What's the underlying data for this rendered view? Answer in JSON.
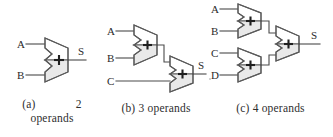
{
  "figure": {
    "background_color": "#ffffff",
    "line_color": "#4a4a4a",
    "adder_fill_color": "#e9e9e9",
    "adder_stroke_color": "#5a5a5a",
    "text_color": "#2b2b2b"
  },
  "panels": [
    {
      "id": "a",
      "caption_line1": "(a)",
      "caption_number": "2",
      "caption_line2": "operands",
      "operand_count": 2,
      "adder_count": 1,
      "inputs": [
        "A",
        "B"
      ],
      "output": "S",
      "adder_symbol": "+"
    },
    {
      "id": "b",
      "caption": "(b) 3 operands",
      "operand_count": 3,
      "adder_count": 2,
      "inputs": [
        "A",
        "B",
        "C"
      ],
      "output": "S",
      "adder_symbol": "+"
    },
    {
      "id": "c",
      "caption": "(c) 4 operands",
      "operand_count": 4,
      "adder_count": 3,
      "inputs": [
        "A",
        "B",
        "C",
        "D"
      ],
      "output": "S",
      "adder_symbol": "+"
    }
  ]
}
